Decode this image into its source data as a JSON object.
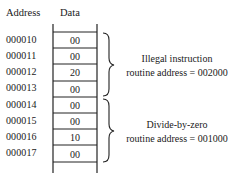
{
  "headers": {
    "address": "Address",
    "data": "Data"
  },
  "rows": [
    {
      "address": "000010",
      "data": "00"
    },
    {
      "address": "000011",
      "data": "00"
    },
    {
      "address": "000012",
      "data": "20"
    },
    {
      "address": "000013",
      "data": "00"
    },
    {
      "address": "000014",
      "data": "00"
    },
    {
      "address": "000015",
      "data": "00"
    },
    {
      "address": "000016",
      "data": "10"
    },
    {
      "address": "000017",
      "data": "00"
    }
  ],
  "groups": [
    {
      "line1": "Illegal instruction",
      "line2": "routine address = 002000"
    },
    {
      "line1": "Divide-by-zero",
      "line2": "routine address = 001000"
    }
  ]
}
